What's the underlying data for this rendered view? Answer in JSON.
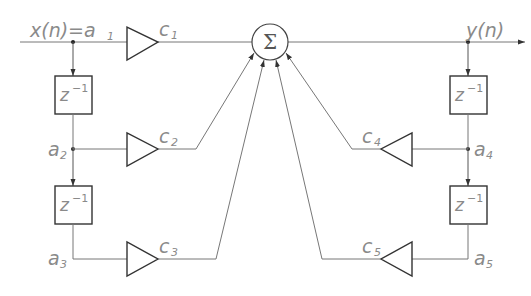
{
  "diagram": {
    "type": "signal-flow",
    "input": {
      "label": "x(n)=a",
      "subscript": "1"
    },
    "output": {
      "label": "y(n)"
    },
    "sum_node": {
      "symbol": "Σ"
    },
    "delay_label": {
      "base": "z",
      "exponent": "−1"
    },
    "nodes": [
      {
        "id": "a1",
        "label": "a",
        "subscript": "1"
      },
      {
        "id": "a2",
        "label": "a",
        "subscript": "2"
      },
      {
        "id": "a3",
        "label": "a",
        "subscript": "3"
      },
      {
        "id": "a4",
        "label": "a",
        "subscript": "4"
      },
      {
        "id": "a5",
        "label": "a",
        "subscript": "5"
      }
    ],
    "gains": [
      {
        "id": "c1",
        "label": "c",
        "subscript": "1"
      },
      {
        "id": "c2",
        "label": "c",
        "subscript": "2"
      },
      {
        "id": "c3",
        "label": "c",
        "subscript": "3"
      },
      {
        "id": "c4",
        "label": "c",
        "subscript": "4"
      },
      {
        "id": "c5",
        "label": "c",
        "subscript": "5"
      }
    ],
    "edges": [
      {
        "from": "a1",
        "to": "c1"
      },
      {
        "from": "c1",
        "to": "sum"
      },
      {
        "from": "a1",
        "to": "delay1"
      },
      {
        "from": "delay1",
        "to": "a2"
      },
      {
        "from": "a2",
        "to": "c2"
      },
      {
        "from": "c2",
        "to": "sum"
      },
      {
        "from": "a2",
        "to": "delay2"
      },
      {
        "from": "delay2",
        "to": "a3"
      },
      {
        "from": "a3",
        "to": "c3"
      },
      {
        "from": "c3",
        "to": "sum"
      },
      {
        "from": "sum",
        "to": "y(n)"
      },
      {
        "from": "y(n)",
        "to": "delay3"
      },
      {
        "from": "delay3",
        "to": "a4"
      },
      {
        "from": "a4",
        "to": "c4"
      },
      {
        "from": "c4",
        "to": "sum"
      },
      {
        "from": "a4",
        "to": "delay4"
      },
      {
        "from": "delay4",
        "to": "a5"
      },
      {
        "from": "a5",
        "to": "c5"
      },
      {
        "from": "c5",
        "to": "sum"
      }
    ]
  }
}
